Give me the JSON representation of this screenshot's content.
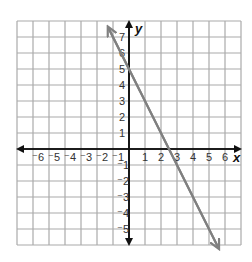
{
  "chart_data": {
    "type": "line",
    "title": "",
    "xlabel": "x",
    "ylabel": "y",
    "xlim": [
      -7,
      7
    ],
    "ylim": [
      -6,
      8
    ],
    "grid": true,
    "x_ticks": [
      "-6",
      "-5",
      "-4",
      "-3",
      "-2",
      "-1",
      "1",
      "2",
      "3",
      "4",
      "5",
      "6"
    ],
    "y_ticks": [
      "7",
      "6",
      "5",
      "4",
      "3",
      "2",
      "1",
      "-1",
      "-2",
      "-3",
      "-4",
      "-5"
    ],
    "series": [
      {
        "name": "y = -2x + 5",
        "equation": "y = -2x + 5",
        "slope": -2,
        "y_intercept": 5,
        "x_intercept": 2.5,
        "points": [
          [
            -1.3,
            7.6
          ],
          [
            0,
            5
          ],
          [
            2.5,
            0
          ],
          [
            5.6,
            -6.2
          ]
        ],
        "arrows_both_ends": true,
        "color": "#808080"
      }
    ],
    "colors": {
      "grid": "#aaaaaa",
      "axes": "#111111",
      "line": "#808080"
    }
  }
}
